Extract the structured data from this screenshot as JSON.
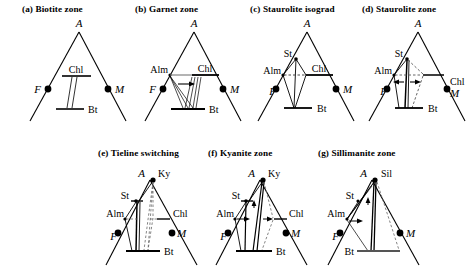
{
  "figure": {
    "kind": "AFM-type compatibility-triangle series",
    "row1_top": 4,
    "row2_top": 148
  },
  "panels": [
    {
      "id": "a",
      "tag": "(a)",
      "title": "Biotite zone",
      "x": 22,
      "y": 4,
      "vertices": {
        "apex": "A",
        "left": "F",
        "right": "M"
      },
      "phases": [
        "A",
        "F",
        "M",
        "Chl",
        "Bt"
      ],
      "labels": {
        "apex": "A",
        "left": "F",
        "right": "M",
        "chl": "Chl",
        "bt": "Bt"
      }
    },
    {
      "id": "b",
      "tag": "(b)",
      "title": "Garnet zone",
      "x": 135,
      "y": 4,
      "vertices": {
        "apex": "A",
        "left": "F",
        "right": "M"
      },
      "phases": [
        "A",
        "F",
        "M",
        "Alm",
        "Chl",
        "Bt"
      ],
      "labels": {
        "apex": "A",
        "left": "F",
        "right": "M",
        "alm": "Alm",
        "chl": "Chl",
        "bt": "Bt"
      }
    },
    {
      "id": "c",
      "tag": "(c)",
      "title": "Staurolite isograd",
      "x": 250,
      "y": 4,
      "vertices": {
        "apex": "A",
        "left": "F",
        "right": "M"
      },
      "phases": [
        "A",
        "F",
        "M",
        "St",
        "Alm",
        "Chl",
        "Bt"
      ],
      "labels": {
        "apex": "A",
        "left": "F",
        "right": "M",
        "st": "St",
        "alm": "Alm",
        "chl": "Chl",
        "bt": "Bt"
      }
    },
    {
      "id": "d",
      "tag": "(d)",
      "title": "Staurolite zone",
      "x": 362,
      "y": 4,
      "vertices": {
        "apex": "A",
        "left": "F",
        "right": "M"
      },
      "phases": [
        "A",
        "F",
        "M",
        "St",
        "Alm",
        "Chl",
        "Bt"
      ],
      "labels": {
        "apex": "A",
        "left": "F",
        "right": "M",
        "st": "St",
        "alm": "Alm",
        "chl": "Chl",
        "bt": "Bt"
      }
    },
    {
      "id": "e",
      "tag": "(e)",
      "title": "Tieline switching",
      "x": 98,
      "y": 148,
      "vertices": {
        "apex": "A",
        "left": "F",
        "right": "M"
      },
      "phases": [
        "A",
        "Ky",
        "F",
        "M",
        "St",
        "Alm",
        "Chl",
        "Bt"
      ],
      "labels": {
        "apex": "A",
        "ky": "Ky",
        "left": "F",
        "right": "M",
        "st": "St",
        "alm": "Alm",
        "chl": "Chl",
        "bt": "Bt"
      }
    },
    {
      "id": "f",
      "tag": "(f)",
      "title": "Kyanite zone",
      "x": 208,
      "y": 148,
      "vertices": {
        "apex": "A",
        "left": "F",
        "right": "M"
      },
      "phases": [
        "A",
        "Ky",
        "F",
        "M",
        "St",
        "Alm",
        "Chl",
        "Bt"
      ],
      "labels": {
        "apex": "A",
        "ky": "Ky",
        "left": "F",
        "right": "M",
        "st": "St",
        "alm": "Alm",
        "chl": "Chl",
        "bt": "Bt"
      }
    },
    {
      "id": "g",
      "tag": "(g)",
      "title": "Sillimanite zone",
      "x": 318,
      "y": 148,
      "vertices": {
        "apex": "A",
        "left": "F",
        "right": "M"
      },
      "phases": [
        "A",
        "Sil",
        "F",
        "M",
        "St",
        "Alm",
        "Bt"
      ],
      "labels": {
        "apex": "A",
        "sil": "Sil",
        "left": "F",
        "right": "M",
        "st": "St",
        "alm": "Alm",
        "bt": "Bt"
      }
    }
  ],
  "style": {
    "line_color": "#000000",
    "dash_color": "#555555",
    "background": "#ffffff"
  }
}
